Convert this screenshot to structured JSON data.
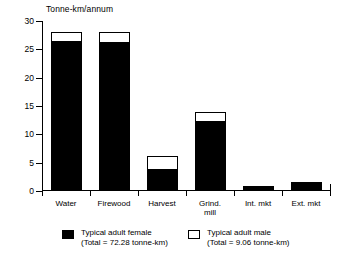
{
  "chart_data": {
    "type": "bar",
    "title": "",
    "subtitle": "",
    "ylabel": "Tonne-km/annum",
    "xlabel": "",
    "ylim": [
      0,
      30
    ],
    "yticks": [
      0,
      5,
      10,
      15,
      20,
      25,
      30
    ],
    "ytick_labels": [
      "0",
      "5",
      "10",
      "15",
      "20",
      "25",
      "30"
    ],
    "grid": false,
    "stacked": true,
    "legend_position": "bottom",
    "categories": [
      "Water",
      "Firewood",
      "Harvest",
      "Grind.\nmill",
      "Int. mkt",
      "Ext. mkt"
    ],
    "series": [
      {
        "name": "Typical adult female",
        "total_label": "(Total = 72.28 tonne-km)",
        "color": "#000000",
        "values": [
          26.3,
          26.1,
          3.75,
          12.1,
          0.5,
          1.25
        ]
      },
      {
        "name": "Typical adult male",
        "total_label": "(Total = 9.06 tonne-km)",
        "color": "#ffffff",
        "values": [
          1.7,
          1.9,
          2.35,
          1.8,
          0.3,
          0.35
        ]
      }
    ],
    "totals": [
      28.0,
      28.0,
      6.1,
      13.9,
      0.8,
      1.6
    ],
    "annotations": []
  },
  "legend": {
    "items": [
      {
        "swatch": "female",
        "line1": "Typical adult female",
        "line2": "(Total = 72.28 tonne-km)"
      },
      {
        "swatch": "male",
        "line1": "Typical adult male",
        "line2": "(Total = 9.06 tonne-km)"
      }
    ]
  }
}
